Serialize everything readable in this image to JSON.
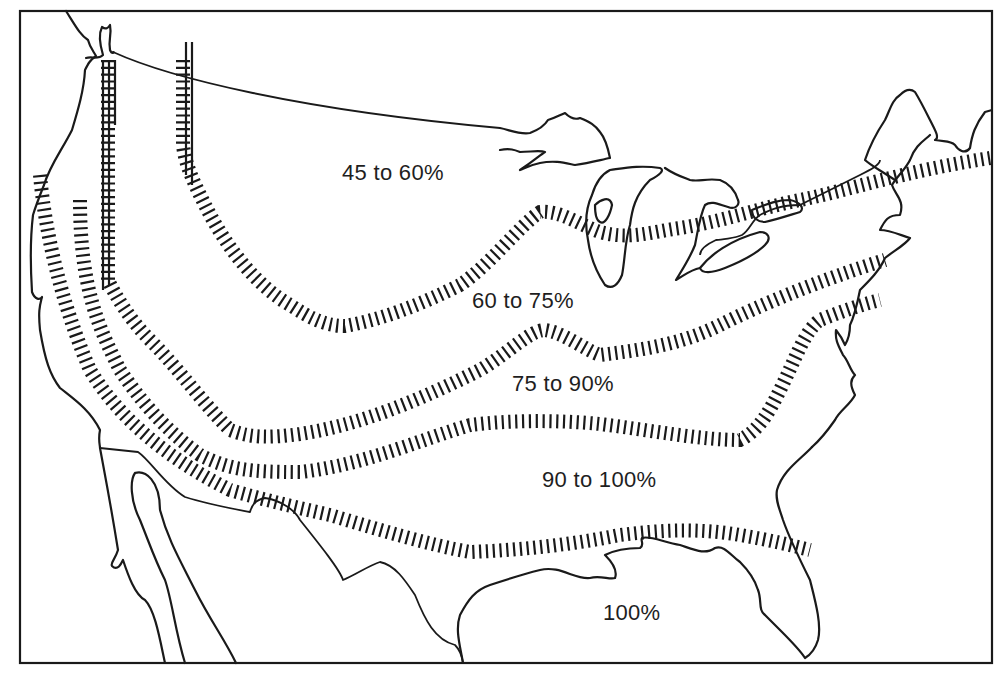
{
  "map": {
    "subject": "Contiguous United States with isoline bands",
    "colors": {
      "ink": "#1a1a1a",
      "background": "#ffffff"
    },
    "zones": [
      {
        "label": "45 to 60%",
        "x": 342,
        "y": 160
      },
      {
        "label": "60 to 75%",
        "x": 472,
        "y": 288
      },
      {
        "label": "75 to 90%",
        "x": 512,
        "y": 371
      },
      {
        "label": "90 to 100%",
        "x": 542,
        "y": 467
      },
      {
        "label": "100%",
        "x": 603,
        "y": 600
      }
    ]
  }
}
